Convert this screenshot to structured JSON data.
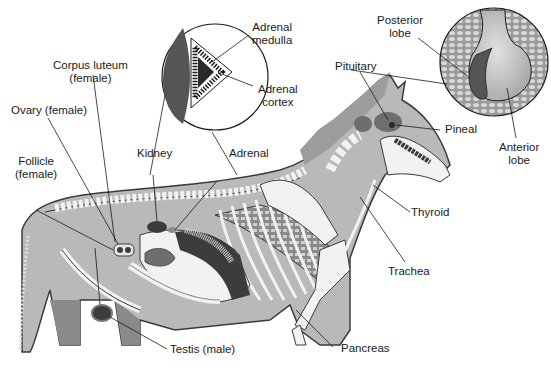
{
  "colors": {
    "background": "#ffffff",
    "body_fill": "#b9b9b9",
    "body_outline": "#3a3a3a",
    "bone": "#f2f2f2",
    "organ_dark": "#3c3c3c",
    "organ_mid": "#6e6e6e",
    "kidney": "#555555",
    "gland_light": "#c8c8c8",
    "text": "#1a1a1a"
  },
  "labels": {
    "adrenal_medulla": [
      "Adrenal",
      "medulla"
    ],
    "adrenal_cortex": [
      "Adrenal",
      "cortex"
    ],
    "corpus_luteum": [
      "Corpus luteum",
      "(female)"
    ],
    "ovary": "Ovary (female)",
    "follicle": [
      "Follicle",
      "(female)"
    ],
    "kidney": "Kidney",
    "adrenal": "Adrenal",
    "posterior_lobe": [
      "Posterior",
      "lobe"
    ],
    "pituitary": "Pituitary",
    "pineal": "Pineal",
    "anterior_lobe": [
      "Anterior",
      "lobe"
    ],
    "thyroid": "Thyroid",
    "trachea": "Trachea",
    "pancreas": "Pancreas",
    "testis": "Testis (male)"
  },
  "insets": [
    {
      "name": "adrenal-kidney-cross-section",
      "center": [
        215,
        77
      ],
      "radius": 53
    },
    {
      "name": "pituitary-detail",
      "center": [
        494,
        62
      ],
      "radius": 54
    }
  ]
}
